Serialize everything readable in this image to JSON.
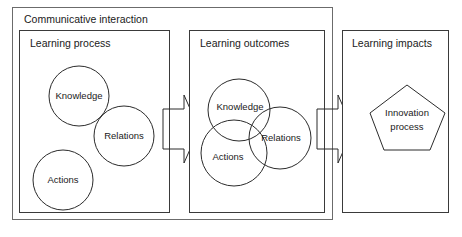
{
  "diagram": {
    "title": "Communicative interaction",
    "outer_frame": {
      "label": "Communicative interaction",
      "stroke_color": "#6b6b6b"
    },
    "panels": [
      {
        "id": "learning-process",
        "title": "Learning process",
        "nodes": [
          {
            "id": "knowledge",
            "label": "Knowledge",
            "shape": "circle"
          },
          {
            "id": "relations",
            "label": "Relations",
            "shape": "circle"
          },
          {
            "id": "actions",
            "label": "Actions",
            "shape": "circle"
          }
        ]
      },
      {
        "id": "learning-outcomes",
        "title": "Learning outcomes",
        "nodes": [
          {
            "id": "knowledge",
            "label": "Knowledge",
            "shape": "circle"
          },
          {
            "id": "relations",
            "label": "Relations",
            "shape": "circle"
          },
          {
            "id": "actions",
            "label": "Actions",
            "shape": "circle"
          }
        ]
      },
      {
        "id": "learning-impacts",
        "title": "Learning impacts",
        "nodes": [
          {
            "id": "innovation-process",
            "label_line1": "Innovation",
            "label_line2": "process",
            "shape": "pentagon"
          }
        ]
      }
    ],
    "arrows": [
      {
        "id": "arrow-process-to-outcomes",
        "direction": "right"
      },
      {
        "id": "arrow-outcomes-to-impacts",
        "direction": "right"
      }
    ],
    "colors": {
      "background": "#ffffff",
      "outer_stroke": "#6b6b6b",
      "panel_stroke": "#3a3a3a",
      "shape_stroke": "#2b2b2b",
      "text": "#1a1a1a"
    }
  }
}
